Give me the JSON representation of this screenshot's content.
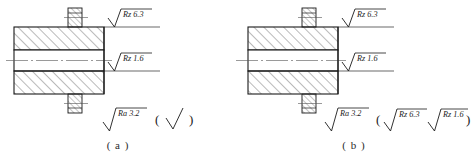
{
  "figure": {
    "type": "engineering-drawing"
  },
  "panels": [
    {
      "id": "a",
      "caption": "( a )",
      "callouts": [
        {
          "name": "upper-surface-callout",
          "symbol": "machined-triangle",
          "text": "Rz 6.3"
        },
        {
          "name": "bore-surface-callout",
          "symbol": "machined-triangle",
          "text": "Rz 1.6"
        }
      ],
      "note": {
        "name": "general-roughness-note",
        "primary_symbol": "machined-triangle",
        "primary_text": "Ra 3.2",
        "open_paren": "(",
        "bracket_items": [
          {
            "symbol": "basic-triangle",
            "text": ""
          }
        ],
        "close_paren": ")"
      }
    },
    {
      "id": "b",
      "caption": "( b )",
      "callouts": [
        {
          "name": "upper-surface-callout",
          "symbol": "machined-triangle",
          "text": "Rz 6.3"
        },
        {
          "name": "bore-surface-callout",
          "symbol": "machined-triangle",
          "text": "Rz 1.6"
        }
      ],
      "note": {
        "name": "general-roughness-note",
        "primary_symbol": "machined-triangle",
        "primary_text": "Ra 3.2",
        "open_paren": "(",
        "bracket_items": [
          {
            "symbol": "machined-triangle",
            "text": "Rz 6.3"
          },
          {
            "symbol": "machined-triangle",
            "text": "Rz 1.6"
          }
        ],
        "close_paren": ")"
      }
    }
  ],
  "colors": {
    "outline": "#1a1a1a",
    "hatch": "#3a3a3a",
    "centerline": "#555555",
    "leader": "#2a2a2a",
    "background": "#ffffff"
  }
}
